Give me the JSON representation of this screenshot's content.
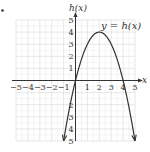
{
  "chart_data": {
    "type": "line",
    "title": "",
    "xlabel": "x",
    "ylabel": "h(x)",
    "curve_label": "y = h(x)",
    "function": "h(x) = -x^2 + 4x",
    "xlim": [
      -5,
      5
    ],
    "ylim": [
      -5,
      5
    ],
    "x_ticks": [
      -5,
      -4,
      -3,
      -2,
      -1,
      1,
      2,
      3,
      4,
      5
    ],
    "y_ticks": [
      -5,
      -4,
      -3,
      -2,
      -1,
      1,
      2,
      3,
      4,
      5
    ],
    "x_tick_labels": [
      "−5",
      "−4",
      "−3",
      "−2",
      "−1",
      "1",
      "2",
      "3",
      "4",
      "5"
    ],
    "y_tick_labels_pos": [
      "1",
      "2",
      "3",
      "4",
      "5"
    ],
    "y_tick_labels_neg": [
      "2",
      "3",
      "4",
      "5"
    ],
    "grid": true,
    "series": [
      {
        "name": "y = h(x)",
        "x": [
          -1,
          0,
          1,
          2,
          3,
          4,
          5
        ],
        "y": [
          -5,
          0,
          3,
          4,
          3,
          0,
          -5
        ]
      }
    ],
    "key_points": {
      "vertex": [
        2,
        4
      ],
      "x_intercepts": [
        0,
        4
      ],
      "y_intercept": 0
    },
    "colors": {
      "curve": "#333333",
      "grid": "#d6d6d6",
      "axis": "#333333"
    }
  }
}
